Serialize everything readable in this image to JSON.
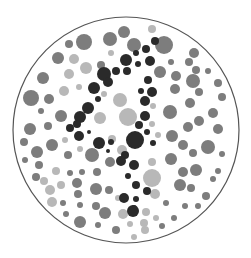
{
  "plate": {
    "type": "ishihara-style color vision test plate (grayscale)",
    "hidden_figure": "4",
    "background": "#ffffff",
    "border": {
      "cx": 126,
      "cy": 130,
      "r": 113,
      "stroke": "#555555",
      "width": 1.2
    },
    "colors": {
      "figure": "#2a2a2a",
      "dark": "#7d7d7d",
      "light": "#b8b8b8"
    },
    "dots": [
      {
        "x": 124,
        "y": 32,
        "r": 6,
        "c": "dark"
      },
      {
        "x": 152,
        "y": 29,
        "r": 4,
        "c": "light"
      },
      {
        "x": 84,
        "y": 42,
        "r": 8,
        "c": "dark"
      },
      {
        "x": 110,
        "y": 39,
        "r": 7,
        "c": "dark"
      },
      {
        "x": 69,
        "y": 44,
        "r": 4,
        "c": "dark"
      },
      {
        "x": 164,
        "y": 45,
        "r": 9,
        "c": "dark"
      },
      {
        "x": 134,
        "y": 45,
        "r": 7,
        "c": "dark"
      },
      {
        "x": 58,
        "y": 58,
        "r": 6,
        "c": "dark"
      },
      {
        "x": 74,
        "y": 59,
        "r": 5,
        "c": "light"
      },
      {
        "x": 111,
        "y": 53,
        "r": 3,
        "c": "light"
      },
      {
        "x": 194,
        "y": 53,
        "r": 5,
        "c": "dark"
      },
      {
        "x": 189,
        "y": 62,
        "r": 4,
        "c": "dark"
      },
      {
        "x": 171,
        "y": 62,
        "r": 3,
        "c": "dark"
      },
      {
        "x": 43,
        "y": 78,
        "r": 6,
        "c": "dark"
      },
      {
        "x": 86,
        "y": 68,
        "r": 6,
        "c": "light"
      },
      {
        "x": 101,
        "y": 65,
        "r": 4,
        "c": "dark"
      },
      {
        "x": 69,
        "y": 74,
        "r": 5,
        "c": "light"
      },
      {
        "x": 160,
        "y": 72,
        "r": 6,
        "c": "dark"
      },
      {
        "x": 196,
        "y": 70,
        "r": 4,
        "c": "dark"
      },
      {
        "x": 208,
        "y": 71,
        "r": 3,
        "c": "dark"
      },
      {
        "x": 176,
        "y": 76,
        "r": 5,
        "c": "dark"
      },
      {
        "x": 193,
        "y": 81,
        "r": 7,
        "c": "dark"
      },
      {
        "x": 218,
        "y": 83,
        "r": 4,
        "c": "dark"
      },
      {
        "x": 64,
        "y": 91,
        "r": 5,
        "c": "light"
      },
      {
        "x": 79,
        "y": 87,
        "r": 3,
        "c": "light"
      },
      {
        "x": 104,
        "y": 94,
        "r": 3,
        "c": "light"
      },
      {
        "x": 175,
        "y": 89,
        "r": 5,
        "c": "dark"
      },
      {
        "x": 199,
        "y": 92,
        "r": 4,
        "c": "dark"
      },
      {
        "x": 31,
        "y": 98,
        "r": 8,
        "c": "dark"
      },
      {
        "x": 49,
        "y": 99,
        "r": 5,
        "c": "dark"
      },
      {
        "x": 120,
        "y": 100,
        "r": 7,
        "c": "light"
      },
      {
        "x": 153,
        "y": 106,
        "r": 3,
        "c": "light"
      },
      {
        "x": 190,
        "y": 103,
        "r": 5,
        "c": "dark"
      },
      {
        "x": 222,
        "y": 97,
        "r": 4,
        "c": "dark"
      },
      {
        "x": 41,
        "y": 111,
        "r": 3,
        "c": "dark"
      },
      {
        "x": 61,
        "y": 116,
        "r": 6,
        "c": "dark"
      },
      {
        "x": 100,
        "y": 118,
        "r": 6,
        "c": "light"
      },
      {
        "x": 128,
        "y": 117,
        "r": 9,
        "c": "light"
      },
      {
        "x": 170,
        "y": 112,
        "r": 7,
        "c": "dark"
      },
      {
        "x": 213,
        "y": 113,
        "r": 5,
        "c": "dark"
      },
      {
        "x": 30,
        "y": 129,
        "r": 6,
        "c": "dark"
      },
      {
        "x": 48,
        "y": 126,
        "r": 4,
        "c": "dark"
      },
      {
        "x": 152,
        "y": 124,
        "r": 3,
        "c": "light"
      },
      {
        "x": 188,
        "y": 127,
        "r": 5,
        "c": "dark"
      },
      {
        "x": 199,
        "y": 121,
        "r": 5,
        "c": "dark"
      },
      {
        "x": 218,
        "y": 129,
        "r": 5,
        "c": "dark"
      },
      {
        "x": 24,
        "y": 142,
        "r": 4,
        "c": "dark"
      },
      {
        "x": 52,
        "y": 145,
        "r": 6,
        "c": "dark"
      },
      {
        "x": 65,
        "y": 140,
        "r": 3,
        "c": "light"
      },
      {
        "x": 112,
        "y": 139,
        "r": 4,
        "c": "light"
      },
      {
        "x": 122,
        "y": 150,
        "r": 5,
        "c": "light"
      },
      {
        "x": 158,
        "y": 135,
        "r": 3,
        "c": "light"
      },
      {
        "x": 172,
        "y": 136,
        "r": 6,
        "c": "dark"
      },
      {
        "x": 183,
        "y": 145,
        "r": 5,
        "c": "dark"
      },
      {
        "x": 208,
        "y": 147,
        "r": 7,
        "c": "dark"
      },
      {
        "x": 37,
        "y": 152,
        "r": 6,
        "c": "dark"
      },
      {
        "x": 68,
        "y": 155,
        "r": 4,
        "c": "dark"
      },
      {
        "x": 80,
        "y": 149,
        "r": 3,
        "c": "light"
      },
      {
        "x": 92,
        "y": 155,
        "r": 7,
        "c": "dark"
      },
      {
        "x": 110,
        "y": 162,
        "r": 5,
        "c": "dark"
      },
      {
        "x": 152,
        "y": 162,
        "r": 4,
        "c": "light"
      },
      {
        "x": 171,
        "y": 159,
        "r": 6,
        "c": "dark"
      },
      {
        "x": 193,
        "y": 153,
        "r": 4,
        "c": "dark"
      },
      {
        "x": 222,
        "y": 154,
        "r": 3,
        "c": "dark"
      },
      {
        "x": 25,
        "y": 160,
        "r": 3,
        "c": "dark"
      },
      {
        "x": 39,
        "y": 165,
        "r": 4,
        "c": "dark"
      },
      {
        "x": 56,
        "y": 171,
        "r": 4,
        "c": "light"
      },
      {
        "x": 70,
        "y": 173,
        "r": 3,
        "c": "dark"
      },
      {
        "x": 82,
        "y": 172,
        "r": 3,
        "c": "dark"
      },
      {
        "x": 97,
        "y": 172,
        "r": 4,
        "c": "dark"
      },
      {
        "x": 152,
        "y": 178,
        "r": 9,
        "c": "light"
      },
      {
        "x": 183,
        "y": 172,
        "r": 5,
        "c": "dark"
      },
      {
        "x": 196,
        "y": 170,
        "r": 6,
        "c": "dark"
      },
      {
        "x": 218,
        "y": 171,
        "r": 3,
        "c": "dark"
      },
      {
        "x": 36,
        "y": 177,
        "r": 4,
        "c": "dark"
      },
      {
        "x": 44,
        "y": 181,
        "r": 4,
        "c": "light"
      },
      {
        "x": 61,
        "y": 185,
        "r": 4,
        "c": "light"
      },
      {
        "x": 77,
        "y": 183,
        "r": 5,
        "c": "dark"
      },
      {
        "x": 96,
        "y": 189,
        "r": 6,
        "c": "dark"
      },
      {
        "x": 109,
        "y": 190,
        "r": 4,
        "c": "dark"
      },
      {
        "x": 180,
        "y": 185,
        "r": 6,
        "c": "dark"
      },
      {
        "x": 191,
        "y": 188,
        "r": 4,
        "c": "dark"
      },
      {
        "x": 213,
        "y": 179,
        "r": 3,
        "c": "dark"
      },
      {
        "x": 50,
        "y": 190,
        "r": 5,
        "c": "light"
      },
      {
        "x": 78,
        "y": 194,
        "r": 4,
        "c": "dark"
      },
      {
        "x": 155,
        "y": 194,
        "r": 5,
        "c": "light"
      },
      {
        "x": 206,
        "y": 196,
        "r": 4,
        "c": "dark"
      },
      {
        "x": 52,
        "y": 202,
        "r": 5,
        "c": "light"
      },
      {
        "x": 63,
        "y": 203,
        "r": 3,
        "c": "dark"
      },
      {
        "x": 80,
        "y": 205,
        "r": 3,
        "c": "dark"
      },
      {
        "x": 96,
        "y": 206,
        "r": 4,
        "c": "dark"
      },
      {
        "x": 118,
        "y": 198,
        "r": 3,
        "c": "light"
      },
      {
        "x": 166,
        "y": 203,
        "r": 3,
        "c": "dark"
      },
      {
        "x": 185,
        "y": 206,
        "r": 3,
        "c": "dark"
      },
      {
        "x": 198,
        "y": 206,
        "r": 3,
        "c": "dark"
      },
      {
        "x": 66,
        "y": 214,
        "r": 3,
        "c": "dark"
      },
      {
        "x": 105,
        "y": 213,
        "r": 6,
        "c": "dark"
      },
      {
        "x": 123,
        "y": 214,
        "r": 5,
        "c": "light"
      },
      {
        "x": 146,
        "y": 212,
        "r": 4,
        "c": "light"
      },
      {
        "x": 156,
        "y": 218,
        "r": 3,
        "c": "light"
      },
      {
        "x": 174,
        "y": 218,
        "r": 3,
        "c": "dark"
      },
      {
        "x": 80,
        "y": 222,
        "r": 6,
        "c": "dark"
      },
      {
        "x": 98,
        "y": 225,
        "r": 3,
        "c": "dark"
      },
      {
        "x": 116,
        "y": 230,
        "r": 4,
        "c": "dark"
      },
      {
        "x": 130,
        "y": 224,
        "r": 3,
        "c": "light"
      },
      {
        "x": 144,
        "y": 223,
        "r": 4,
        "c": "light"
      },
      {
        "x": 145,
        "y": 230,
        "r": 4,
        "c": "light"
      },
      {
        "x": 162,
        "y": 226,
        "r": 3,
        "c": "dark"
      },
      {
        "x": 134,
        "y": 237,
        "r": 3,
        "c": "light"
      },
      {
        "x": 155,
        "y": 41,
        "r": 4,
        "c": "figure"
      },
      {
        "x": 146,
        "y": 49,
        "r": 4,
        "c": "figure"
      },
      {
        "x": 136,
        "y": 53,
        "r": 3,
        "c": "figure"
      },
      {
        "x": 126,
        "y": 60,
        "r": 6,
        "c": "figure"
      },
      {
        "x": 138,
        "y": 64,
        "r": 3,
        "c": "figure"
      },
      {
        "x": 150,
        "y": 61,
        "r": 5,
        "c": "figure"
      },
      {
        "x": 116,
        "y": 71,
        "r": 4,
        "c": "figure"
      },
      {
        "x": 104,
        "y": 74,
        "r": 7,
        "c": "figure"
      },
      {
        "x": 108,
        "y": 82,
        "r": 5,
        "c": "figure"
      },
      {
        "x": 127,
        "y": 71,
        "r": 4,
        "c": "figure"
      },
      {
        "x": 148,
        "y": 80,
        "r": 4,
        "c": "figure"
      },
      {
        "x": 94,
        "y": 88,
        "r": 6,
        "c": "figure"
      },
      {
        "x": 98,
        "y": 99,
        "r": 3,
        "c": "figure"
      },
      {
        "x": 141,
        "y": 91,
        "r": 3,
        "c": "figure"
      },
      {
        "x": 152,
        "y": 92,
        "r": 5,
        "c": "figure"
      },
      {
        "x": 145,
        "y": 101,
        "r": 5,
        "c": "figure"
      },
      {
        "x": 88,
        "y": 108,
        "r": 6,
        "c": "figure"
      },
      {
        "x": 80,
        "y": 117,
        "r": 6,
        "c": "figure"
      },
      {
        "x": 77,
        "y": 124,
        "r": 4,
        "c": "figure"
      },
      {
        "x": 145,
        "y": 116,
        "r": 5,
        "c": "figure"
      },
      {
        "x": 70,
        "y": 128,
        "r": 4,
        "c": "figure"
      },
      {
        "x": 139,
        "y": 125,
        "r": 4,
        "c": "figure"
      },
      {
        "x": 79,
        "y": 136,
        "r": 5,
        "c": "figure"
      },
      {
        "x": 89,
        "y": 132,
        "r": 2,
        "c": "figure"
      },
      {
        "x": 99,
        "y": 143,
        "r": 6,
        "c": "figure"
      },
      {
        "x": 111,
        "y": 142,
        "r": 3,
        "c": "figure"
      },
      {
        "x": 135,
        "y": 140,
        "r": 9,
        "c": "figure"
      },
      {
        "x": 147,
        "y": 132,
        "r": 3,
        "c": "figure"
      },
      {
        "x": 153,
        "y": 143,
        "r": 3,
        "c": "figure"
      },
      {
        "x": 108,
        "y": 151,
        "r": 2,
        "c": "figure"
      },
      {
        "x": 125,
        "y": 155,
        "r": 4,
        "c": "figure"
      },
      {
        "x": 121,
        "y": 161,
        "r": 5,
        "c": "figure"
      },
      {
        "x": 134,
        "y": 165,
        "r": 5,
        "c": "figure"
      },
      {
        "x": 128,
        "y": 176,
        "r": 3,
        "c": "figure"
      },
      {
        "x": 136,
        "y": 185,
        "r": 4,
        "c": "figure"
      },
      {
        "x": 147,
        "y": 191,
        "r": 4,
        "c": "figure"
      },
      {
        "x": 124,
        "y": 198,
        "r": 5,
        "c": "figure"
      },
      {
        "x": 136,
        "y": 199,
        "r": 3,
        "c": "figure"
      },
      {
        "x": 134,
        "y": 208,
        "r": 3,
        "c": "figure"
      },
      {
        "x": 133,
        "y": 211,
        "r": 6,
        "c": "figure"
      }
    ]
  }
}
